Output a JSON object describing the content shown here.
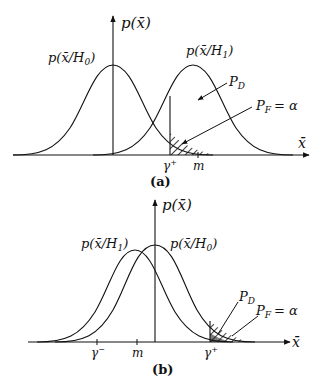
{
  "figure_a": {
    "caption": "(a)",
    "y_axis_label": "p(x̄)",
    "x_axis_label": "x̄",
    "curve_h0_label": "p(x̄/H",
    "curve_h0_sub": "0",
    "curve_h1_label": "p(x̄/H",
    "curve_h1_sub": "1",
    "pd_label": "P",
    "pd_sub": "D",
    "pf_label": "P",
    "pf_sub": "F",
    "pf_eq": "= α",
    "threshold_label": "γ",
    "threshold_sup": "+",
    "mean_label": "m"
  },
  "figure_b": {
    "caption": "(b)",
    "y_axis_label": "p(x̄)",
    "x_axis_label": "x̄",
    "curve_h1_label": "p(x̄/H",
    "curve_h1_sub": "1",
    "curve_h0_label": "p(x̄/H",
    "curve_h0_sub": "0",
    "pd_label": "P",
    "pd_sub": "D",
    "pf_label": "P",
    "pf_sub": "F",
    "pf_eq": "= α",
    "threshold_minus_label": "γ",
    "threshold_minus_sup": "−",
    "mean_label": "m",
    "threshold_plus_label": "γ",
    "threshold_plus_sup": "+"
  }
}
